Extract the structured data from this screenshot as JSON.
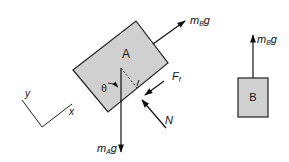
{
  "diagram": {
    "block_a": {
      "label": "A",
      "fill": "#d0d0d0"
    },
    "block_b": {
      "label": "B",
      "fill": "#d0d0d0"
    },
    "forces": {
      "tension_a": {
        "symbol": "m",
        "subscript": "B",
        "suffix": "g"
      },
      "weight_a": {
        "symbol": "m",
        "subscript": "A",
        "suffix": "g"
      },
      "friction": {
        "symbol": "F",
        "subscript": "f"
      },
      "normal": {
        "symbol": "N"
      },
      "tension_b": {
        "symbol": "m",
        "subscript": "B",
        "suffix": "g"
      }
    },
    "angle": {
      "symbol": "θ"
    },
    "axes": {
      "x_label": "x",
      "y_label": "y"
    }
  }
}
